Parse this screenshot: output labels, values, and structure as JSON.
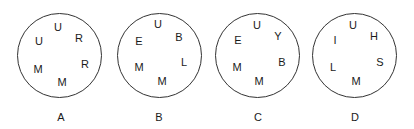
{
  "figures": [
    {
      "label": "A",
      "letters": [
        "U",
        "R",
        "U",
        "R",
        "M",
        "M"
      ]
    },
    {
      "label": "B",
      "letters": [
        "U",
        "B",
        "E",
        "L",
        "M",
        "M"
      ]
    },
    {
      "label": "C",
      "letters": [
        "U",
        "Y",
        "E",
        "B",
        "M",
        "M"
      ]
    },
    {
      "label": "D",
      "letters": [
        "U",
        "H",
        "I",
        "S",
        "L",
        "M"
      ]
    }
  ]
}
